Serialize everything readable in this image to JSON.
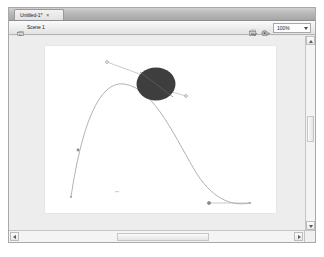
{
  "window": {
    "name": "document-window"
  },
  "tab_bar": {
    "tabs": [
      {
        "label": "Untitled-1*",
        "close_glyph": "×",
        "active": true
      }
    ]
  },
  "edit_bar": {
    "back_icon": "back-arrow-icon",
    "scene_icon": "scene-icon",
    "scene_label": "Scene 1",
    "edit_scene_icon": "edit-scene-icon",
    "edit_symbols_icon": "edit-symbols-icon",
    "zoom_value": "100%",
    "zoom_options": [
      "25%",
      "50%",
      "100%",
      "200%",
      "400%",
      "800%",
      "Fit in Window",
      "Show Frame",
      "Show All"
    ]
  },
  "stage": {
    "background_color": "#ffffff",
    "pasteboard_color": "#ededed",
    "width_px": 231,
    "height_px": 167
  },
  "artwork": {
    "motion_path": {
      "name": "motion-guide-path",
      "stroke_color": "#9a9a9a",
      "stroke_width": 0.7,
      "d": "M 26 151 C 33 104, 48 34, 79 38 C 110 42, 132 96, 152 128 C 170 156, 190 160, 205 157"
    },
    "object": {
      "name": "circle-symbol",
      "shape": "ellipse",
      "fill_color": "#3e3e3e",
      "cx": 111,
      "cy": 38,
      "rx": 19,
      "ry": 16,
      "registration_line": true
    },
    "control_handles": [
      {
        "name": "handle-upper-left",
        "x1": 108,
        "y1": 33,
        "x2": 62,
        "y2": 16,
        "point_color": "#8a8a8a"
      },
      {
        "name": "handle-upper-right",
        "x1": 113,
        "y1": 42,
        "x2": 141,
        "y2": 50,
        "point_color": "#8a8a8a"
      },
      {
        "name": "handle-lower-right",
        "x1": 205,
        "y1": 157,
        "x2": 164,
        "y2": 157,
        "point_color": "#8a8a8a"
      }
    ],
    "anchor_points": [
      {
        "name": "anchor-start",
        "x": 26,
        "y": 151
      },
      {
        "name": "anchor-mid-left",
        "x": 33,
        "y": 104
      },
      {
        "name": "anchor-end",
        "x": 205,
        "y": 157
      },
      {
        "name": "anchor-tween-marker",
        "x": 71,
        "y": 146
      }
    ]
  },
  "scrollbars": {
    "vertical": {
      "name": "vertical-scrollbar",
      "up_glyph": "▲",
      "down_glyph": "▼",
      "thumb_top_pct": 41,
      "thumb_height_pct": 13
    },
    "horizontal": {
      "name": "horizontal-scrollbar",
      "left_glyph": "◀",
      "right_glyph": "▶",
      "thumb_left_pct": 35,
      "thumb_width_pct": 30
    }
  }
}
